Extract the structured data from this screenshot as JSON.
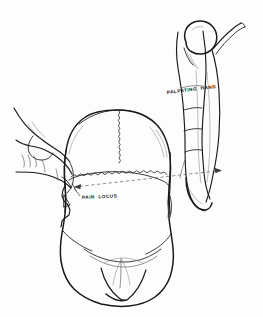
{
  "figure": {
    "type": "anatomical-line-drawing",
    "view": "superior view of human skull with two hands",
    "background_color": "#fdfdfd",
    "ink_color": "#1a1a1a",
    "dashed_line_color": "#5c5c5c"
  },
  "labels": {
    "palpating_hand": "PALPATING  HAND",
    "pain_locus": "PAIN  LOCUS"
  },
  "annotations": {
    "reference_line": {
      "style": "dashed",
      "from": "pain-locus",
      "to": "palpating-hand",
      "arrow_head": "right"
    },
    "leader_line": {
      "style": "solid",
      "target": "pain-locus-point"
    }
  },
  "anatomy": {
    "skull": "cranium-superior-view",
    "sutures": [
      "sagittal-suture",
      "coronal-suture"
    ],
    "face": "mandible-and-maxilla-foreshortened"
  },
  "hands": {
    "left": "pointing-hand-index-finger-extended",
    "right": "palpating-hand-thumb-and-fingers"
  }
}
